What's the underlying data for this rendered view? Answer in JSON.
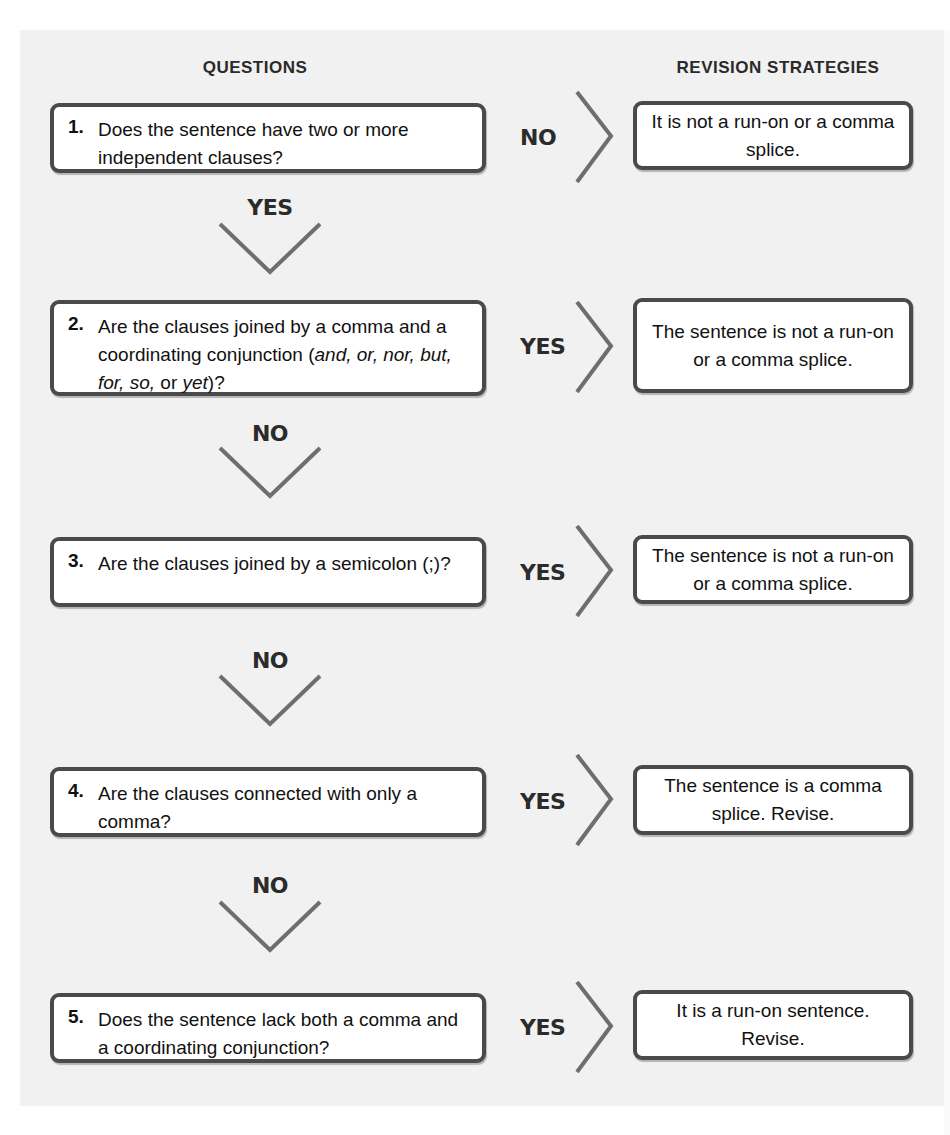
{
  "headers": {
    "questions": "QUESTIONS",
    "revision_strategies": "REVISION STRATEGIES"
  },
  "rows": [
    {
      "number": "1.",
      "question": "Does the sentence have two or more independent clauses?",
      "side_label": "NO",
      "answer": "It is not a run-on or a comma splice.",
      "down_label": "YES"
    },
    {
      "number": "2.",
      "question_parts": {
        "a": "Are the clauses joined by a comma and a coordinating conjunction (",
        "b": "and, or, nor, but, for, so,",
        "c": " or ",
        "d": "yet",
        "e": ")?"
      },
      "side_label": "YES",
      "answer": "The sentence is not a run-on or a comma splice.",
      "down_label": "NO"
    },
    {
      "number": "3.",
      "question": "Are the clauses joined by a semicolon (;)?",
      "side_label": "YES",
      "answer": "The sentence is not a run-on or a comma splice.",
      "down_label": "NO"
    },
    {
      "number": "4.",
      "question": "Are the clauses connected with only a comma?",
      "side_label": "YES",
      "answer": "The sentence is a comma splice. Revise.",
      "down_label": "NO"
    },
    {
      "number": "5.",
      "question": "Does the sentence lack both a comma and a coordinating conjunction?",
      "side_label": "YES",
      "answer": "It is a run-on sentence. Revise."
    }
  ],
  "colors": {
    "panel_background": "#f1f1f1",
    "box_border": "#4a4a4a",
    "arrow": "#6e6e6e",
    "text": "#111111"
  }
}
